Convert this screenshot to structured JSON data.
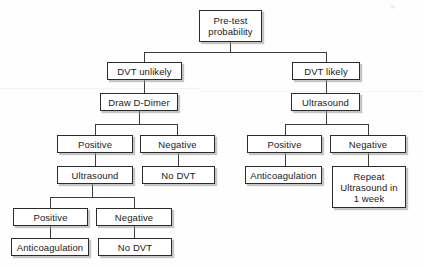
{
  "diagram": {
    "nodes": [
      {
        "id": "pretest",
        "label": "Pre-test\nprobability",
        "x": 199,
        "y": 10,
        "w": 63,
        "h": 32
      },
      {
        "id": "dvt-unlikely",
        "label": "DVT unlikely",
        "x": 107,
        "y": 62,
        "w": 75,
        "h": 18
      },
      {
        "id": "dvt-likely",
        "label": "DVT likely",
        "x": 292,
        "y": 62,
        "w": 68,
        "h": 18
      },
      {
        "id": "draw-d-dimer",
        "label": "Draw D-Dimer",
        "x": 100,
        "y": 93,
        "w": 78,
        "h": 18
      },
      {
        "id": "ultrasound-r1",
        "label": "Ultrasound",
        "x": 291,
        "y": 93,
        "w": 69,
        "h": 18
      },
      {
        "id": "pos-l1",
        "label": "Positive",
        "x": 57,
        "y": 135,
        "w": 76,
        "h": 18
      },
      {
        "id": "neg-l1",
        "label": "Negative",
        "x": 140,
        "y": 135,
        "w": 75,
        "h": 18
      },
      {
        "id": "pos-r1",
        "label": "Positive",
        "x": 247,
        "y": 135,
        "w": 75,
        "h": 18
      },
      {
        "id": "neg-r1",
        "label": "Negative",
        "x": 330,
        "y": 135,
        "w": 76,
        "h": 18
      },
      {
        "id": "ultrasound-l2",
        "label": "Ultrasound",
        "x": 57,
        "y": 166,
        "w": 76,
        "h": 18
      },
      {
        "id": "no-dvt-l1",
        "label": "No DVT",
        "x": 142,
        "y": 166,
        "w": 73,
        "h": 18
      },
      {
        "id": "anticoag-r1",
        "label": "Anticoagulation",
        "x": 245,
        "y": 166,
        "w": 77,
        "h": 18
      },
      {
        "id": "repeat-us",
        "label": "Repeat\nUltrasound in\n1 week",
        "x": 332,
        "y": 166,
        "w": 74,
        "h": 42
      },
      {
        "id": "pos-l2",
        "label": "Positive",
        "x": 13,
        "y": 208,
        "w": 75,
        "h": 18
      },
      {
        "id": "neg-l2",
        "label": "Negative",
        "x": 96,
        "y": 208,
        "w": 76,
        "h": 18
      },
      {
        "id": "anticoag-l1",
        "label": "Anticoagulation",
        "x": 11,
        "y": 238,
        "w": 78,
        "h": 18
      },
      {
        "id": "no-dvt-l2",
        "label": "No DVT",
        "x": 98,
        "y": 238,
        "w": 74,
        "h": 18
      }
    ],
    "connectors": [
      {
        "id": "pretest-stem",
        "orient": "v",
        "x": 230,
        "y": 42,
        "len": 10
      },
      {
        "id": "pretest-bar",
        "orient": "h",
        "x": 144,
        "y": 52,
        "len": 182
      },
      {
        "id": "to-dvt-unlikely",
        "orient": "v",
        "x": 144,
        "y": 52,
        "len": 10
      },
      {
        "id": "to-dvt-likely",
        "orient": "v",
        "x": 326,
        "y": 52,
        "len": 10
      },
      {
        "id": "unlikely-stem",
        "orient": "v",
        "x": 144,
        "y": 80,
        "len": 13
      },
      {
        "id": "likely-stem",
        "orient": "v",
        "x": 326,
        "y": 80,
        "len": 13
      },
      {
        "id": "ddimer-stem",
        "orient": "v",
        "x": 139,
        "y": 111,
        "len": 13
      },
      {
        "id": "ddimer-bar",
        "orient": "h",
        "x": 95,
        "y": 124,
        "len": 83
      },
      {
        "id": "to-pos-l1",
        "orient": "v",
        "x": 95,
        "y": 124,
        "len": 11
      },
      {
        "id": "to-neg-l1",
        "orient": "v",
        "x": 177,
        "y": 124,
        "len": 11
      },
      {
        "id": "us-r1-stem",
        "orient": "v",
        "x": 326,
        "y": 111,
        "len": 13
      },
      {
        "id": "us-r1-bar",
        "orient": "h",
        "x": 285,
        "y": 124,
        "len": 83
      },
      {
        "id": "to-pos-r1",
        "orient": "v",
        "x": 285,
        "y": 124,
        "len": 11
      },
      {
        "id": "to-neg-r1",
        "orient": "v",
        "x": 368,
        "y": 124,
        "len": 11
      },
      {
        "id": "pos-l1-stem",
        "orient": "v",
        "x": 95,
        "y": 153,
        "len": 13
      },
      {
        "id": "neg-l1-stem",
        "orient": "v",
        "x": 178,
        "y": 153,
        "len": 13
      },
      {
        "id": "pos-r1-stem",
        "orient": "v",
        "x": 285,
        "y": 153,
        "len": 13
      },
      {
        "id": "neg-r1-stem",
        "orient": "v",
        "x": 368,
        "y": 153,
        "len": 13
      },
      {
        "id": "us-l2-stem",
        "orient": "v",
        "x": 92,
        "y": 184,
        "len": 13
      },
      {
        "id": "us-l2-bar",
        "orient": "h",
        "x": 50,
        "y": 197,
        "len": 84
      },
      {
        "id": "to-pos-l2",
        "orient": "v",
        "x": 50,
        "y": 197,
        "len": 11
      },
      {
        "id": "to-neg-l2",
        "orient": "v",
        "x": 134,
        "y": 197,
        "len": 11
      },
      {
        "id": "pos-l2-stem",
        "orient": "v",
        "x": 50,
        "y": 226,
        "len": 12
      },
      {
        "id": "neg-l2-stem",
        "orient": "v",
        "x": 134,
        "y": 226,
        "len": 12
      }
    ],
    "artifacts": {
      "scan_line_label": "scanner-streak",
      "corner_mark": "✶"
    }
  }
}
